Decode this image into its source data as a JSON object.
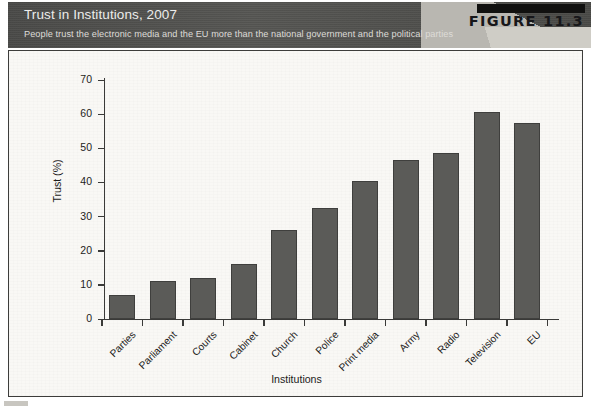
{
  "figure": {
    "badge": "FIGURE 11.3",
    "title": "Trust in Institutions, 2007",
    "subtitle": "People trust the electronic media and the EU more than the national government and the political parties"
  },
  "colors": {
    "bar_fill": "#5b5b58",
    "bar_edge": "#3f3f3d",
    "header_band": "#4e4e4c",
    "panel_bg": "#f9f8f5",
    "axis": "#3a3a38"
  },
  "chart_data": {
    "type": "bar",
    "title": "Trust in Institutions, 2007",
    "subtitle": "People trust the electronic media and the EU more than the national government and the political parties",
    "xlabel": "Institutions",
    "ylabel": "Trust (%)",
    "ylim": [
      0,
      70
    ],
    "yticks": [
      0,
      10,
      20,
      30,
      40,
      50,
      60,
      70
    ],
    "grid": false,
    "legend": false,
    "categories": [
      "Parties",
      "Parliament",
      "Courts",
      "Cabinet",
      "Church",
      "Police",
      "Print media",
      "Army",
      "Radio",
      "Television",
      "EU"
    ],
    "values": [
      7,
      11,
      12,
      16,
      26,
      32.5,
      40.5,
      46.5,
      48.5,
      60.5,
      57.5
    ]
  }
}
